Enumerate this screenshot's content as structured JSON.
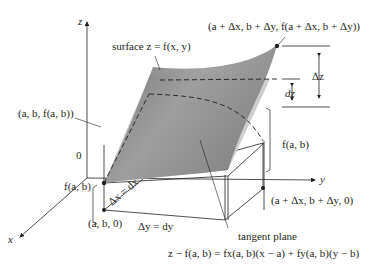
{
  "diagram": {
    "colors": {
      "surface": "#8c8c8c",
      "surface_light": "#b5b5b5",
      "tangent_plane": "#c8c8c8",
      "lines": "#231f20",
      "background": "#ffffff"
    },
    "axes": {
      "z_label": "z",
      "x_label": "x",
      "y_label": "y",
      "origin_label": "0"
    },
    "labels": {
      "surface": "surface z = f(x, y)",
      "point_top": "(a + Δx, b + Δy, f(a + Δx, b + Δy))",
      "point_left": "(a, b, f(a, b))",
      "delta_z": "Δz",
      "dz": "dz",
      "fab_right": "f(a, b)",
      "fab_left": "f(a, b)",
      "delta_x": "Δx = dx",
      "point_base_left": "(a, b, 0)",
      "delta_y": "Δy = dy",
      "point_base_right": "(a + Δx, b + Δy, 0)",
      "tangent_plane": "tangent plane",
      "tangent_equation": "z − f(a, b) = fx(a, b)(x − a) + fy(a, b)(y − b)"
    }
  }
}
